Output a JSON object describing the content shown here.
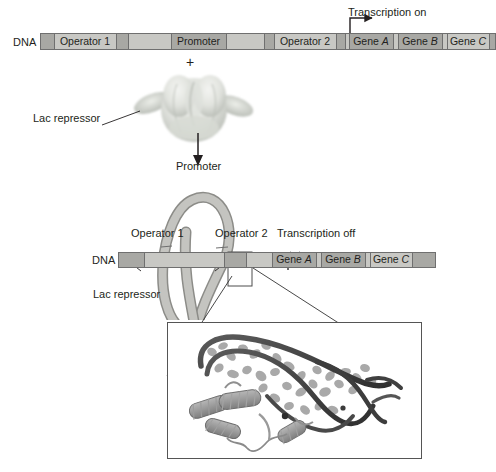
{
  "figure": {
    "background_color": "#ffffff"
  },
  "colors": {
    "dna_light": "#c8c8c4",
    "dna_dark": "#a8a8a4",
    "dna_outline": "#6f6f6f",
    "repressor_fill": "#e4e6e1",
    "repressor_shade": "#b9bdb6",
    "text": "#231f20",
    "inset_border": "#555555",
    "structure_dna": "#4a4a4a",
    "structure_protein": "#8d8d8d"
  },
  "top_panel": {
    "dna_label": "DNA",
    "transcription_label": "Transcription on",
    "segments": [
      {
        "label": "",
        "shade": "dark",
        "x": 40,
        "width": 14
      },
      {
        "label": "Operator 1",
        "shade": "light",
        "x": 54,
        "width": 62
      },
      {
        "label": "",
        "shade": "dark",
        "x": 116,
        "width": 12
      },
      {
        "label": "",
        "shade": "light",
        "x": 128,
        "width": 43
      },
      {
        "label": "Promoter",
        "shade": "dark",
        "x": 171,
        "width": 55
      },
      {
        "label": "",
        "shade": "light",
        "x": 226,
        "width": 38
      },
      {
        "label": "",
        "shade": "dark",
        "x": 264,
        "width": 10
      },
      {
        "label": "Operator 2",
        "shade": "light",
        "x": 274,
        "width": 62
      },
      {
        "label": "",
        "shade": "dark",
        "x": 336,
        "width": 9
      },
      {
        "label": "",
        "shade": "light",
        "x": 345,
        "width": 4
      },
      {
        "label": "Gene A",
        "shade": "dark",
        "x": 349,
        "width": 44,
        "italic_last": true
      },
      {
        "label": "",
        "shade": "light",
        "x": 393,
        "width": 5
      },
      {
        "label": "Gene B",
        "shade": "dark",
        "x": 398,
        "width": 44,
        "italic_last": true
      },
      {
        "label": "",
        "shade": "light",
        "x": 442,
        "width": 5
      },
      {
        "label": "Gene C",
        "shade": "light",
        "x": 447,
        "width": 42,
        "italic_last": true
      },
      {
        "label": "",
        "shade": "dark",
        "x": 489,
        "width": 7
      }
    ]
  },
  "plus_sign": "+",
  "repressor_top": {
    "label": "Lac repressor"
  },
  "bottom_panel": {
    "dna_label": "DNA",
    "promoter_label": "Promoter",
    "operator1_label": "Operator 1",
    "operator2_label": "Operator 2",
    "transcription_label": "Transcription off",
    "repressor_label": "Lac repressor",
    "segments": [
      {
        "label": "",
        "shade": "dark",
        "x": 118,
        "width": 26
      },
      {
        "label": "",
        "shade": "light",
        "x": 144,
        "width": 80
      },
      {
        "label": "",
        "shade": "dark",
        "x": 224,
        "width": 22
      },
      {
        "label": "",
        "shade": "light",
        "x": 246,
        "width": 26
      },
      {
        "label": "Gene A",
        "shade": "dark",
        "x": 272,
        "width": 44,
        "italic_last": true
      },
      {
        "label": "",
        "shade": "light",
        "x": 316,
        "width": 5
      },
      {
        "label": "Gene B",
        "shade": "dark",
        "x": 321,
        "width": 44,
        "italic_last": true
      },
      {
        "label": "",
        "shade": "light",
        "x": 365,
        "width": 5
      },
      {
        "label": "Gene C",
        "shade": "light",
        "x": 370,
        "width": 42,
        "italic_last": true
      },
      {
        "label": "",
        "shade": "dark",
        "x": 412,
        "width": 24
      }
    ]
  },
  "inset": {
    "caption": "",
    "description": "Crystal structure of Lac repressor headpiece bound to operator DNA"
  }
}
